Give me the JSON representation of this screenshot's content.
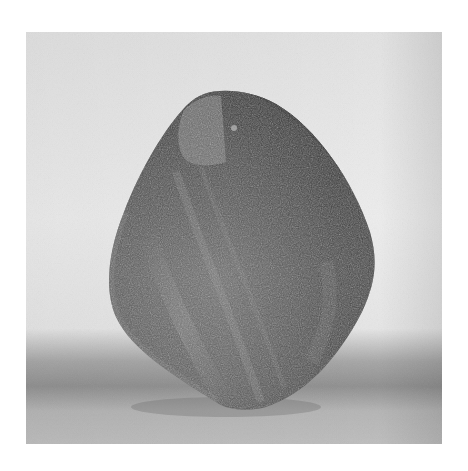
{
  "image": {
    "subject": "stone-sculpture",
    "style": "black-and-white photograph",
    "colors": {
      "page_background": "#ffffff",
      "backdrop_top": "#e4e4e4",
      "backdrop_mid": "#ececec",
      "floor_shadow": "#8f8f8f",
      "floor": "#b9b9b9",
      "stone_light": "#8a8a8a",
      "stone_mid": "#5e5e5e",
      "stone_dark": "#2e2e2e"
    }
  }
}
